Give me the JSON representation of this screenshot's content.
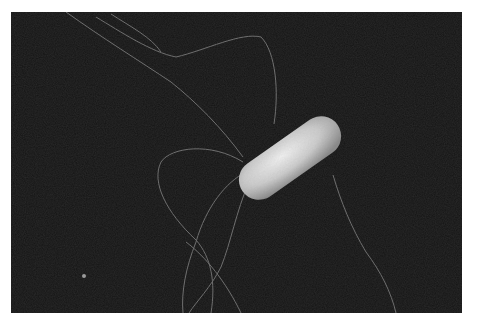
{
  "figure": {
    "imaging": "scanning electron micrograph",
    "background_color": "#161616",
    "cell_color": "#d8d8d8",
    "flagella_color": "#8a8a8a"
  },
  "caption": {
    "text": ""
  }
}
